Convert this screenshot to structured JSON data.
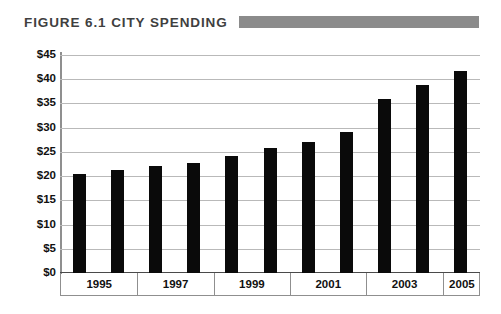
{
  "figure": {
    "title": "FIGURE 6.1 CITY SPENDING",
    "title_rule_color": "#8b8b8b",
    "background_color": "#ffffff"
  },
  "chart_data": {
    "type": "bar",
    "title": "FIGURE 6.1 CITY SPENDING",
    "xlabel": "",
    "ylabel": "",
    "categories": [
      "1995",
      "1996",
      "1997",
      "1998",
      "1999",
      "2000",
      "2001",
      "2002",
      "2003",
      "2004",
      "2005"
    ],
    "values": [
      20.5,
      21.3,
      22.0,
      22.8,
      24.2,
      25.8,
      27.0,
      29.2,
      36.0,
      38.8,
      41.8
    ],
    "x_tick_labels": [
      "1995",
      "1997",
      "1999",
      "2001",
      "2003",
      "2005"
    ],
    "y_tick_labels": [
      "$45",
      "$40",
      "$35",
      "$30",
      "$25",
      "$20",
      "$15",
      "$10",
      "$5",
      "$0"
    ],
    "y_tick_values": [
      45,
      40,
      35,
      30,
      25,
      20,
      15,
      10,
      5,
      0
    ],
    "ylim": [
      0,
      45
    ],
    "grid": true,
    "legend": false,
    "bar_color": "#0a0a0a",
    "gridline_color": "#b9b9b9",
    "axis_color": "#8f8f8f"
  }
}
